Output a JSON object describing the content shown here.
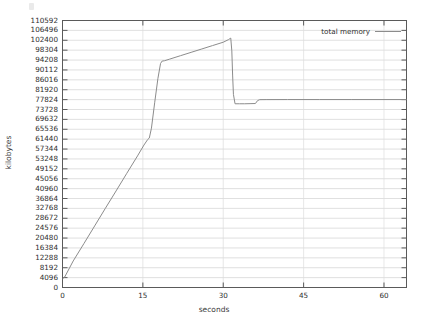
{
  "chart_data": {
    "type": "line",
    "title": "",
    "xlabel": "seconds",
    "ylabel": "kilobytes",
    "xlim": [
      0,
      64.2
    ],
    "ylim": [
      0,
      110592
    ],
    "grid": true,
    "legend_position": "top-right",
    "y_tick_step": 4096,
    "y_ticks": [
      0,
      4096,
      8192,
      12288,
      16384,
      20480,
      24576,
      28672,
      32768,
      36864,
      40960,
      45056,
      49152,
      53248,
      57344,
      61440,
      65536,
      69632,
      73728,
      77824,
      81920,
      86016,
      90112,
      94208,
      98304,
      102400,
      106496,
      110592
    ],
    "x_ticks": [
      0,
      15,
      30,
      45,
      60
    ],
    "series": [
      {
        "name": "total memory",
        "color": "#8c8c8c",
        "x": [
          0.0,
          0.4,
          2.0,
          4.0,
          6.0,
          8.0,
          10.0,
          12.0,
          14.0,
          15.2,
          15.9,
          16.2,
          16.6,
          17.2,
          17.8,
          18.3,
          18.6,
          19.0,
          20.0,
          22.0,
          24.0,
          26.0,
          28.0,
          30.0,
          31.0,
          31.4,
          31.6,
          31.75,
          31.9,
          32.2,
          33.0,
          34.0,
          35.0,
          36.0,
          36.4,
          36.8,
          38.0,
          42.0,
          48.0,
          54.0,
          60.0,
          64.2
        ],
        "y": [
          3600,
          4300,
          11000,
          18200,
          25500,
          32800,
          40000,
          47300,
          54500,
          59000,
          61300,
          61900,
          66000,
          76500,
          86500,
          92800,
          93800,
          93900,
          94600,
          96000,
          97400,
          98800,
          100200,
          101600,
          102700,
          103300,
          98000,
          88000,
          80000,
          76100,
          76100,
          76100,
          76150,
          76200,
          77400,
          77800,
          77830,
          77850,
          77850,
          77850,
          77850,
          77850
        ]
      }
    ]
  },
  "legend": {
    "entries": [
      {
        "label": "total memory"
      }
    ]
  },
  "axes": {
    "x_title": "seconds",
    "y_title": "kilobytes"
  }
}
